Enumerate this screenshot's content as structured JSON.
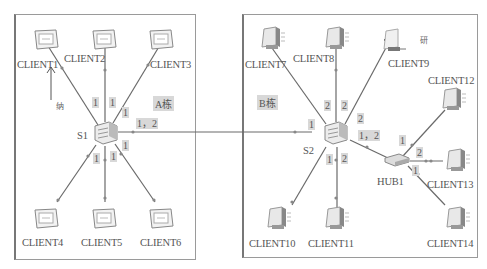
{
  "zones": [
    {
      "id": "A",
      "label": "A栋"
    },
    {
      "id": "B",
      "label": "B栋"
    }
  ],
  "notes": {
    "arrow_a": "纳",
    "arrow_b": "研"
  },
  "devices": {
    "s1": "S1",
    "s2": "S2",
    "hub1": "HUB1",
    "clients": [
      "CLIENT1",
      "CLIENT2",
      "CLIENT3",
      "CLIENT4",
      "CLIENT5",
      "CLIENT6",
      "CLIENT7",
      "CLIENT8",
      "CLIENT9",
      "CLIENT10",
      "CLIENT11",
      "CLIENT12",
      "CLIENT13",
      "CLIENT14"
    ]
  },
  "ports": {
    "c1": "1",
    "c2": "1",
    "c3": "1",
    "c4": "1",
    "c5": "1",
    "c6": "1",
    "s1_trunk": "1，2",
    "s2_in": "1",
    "c7": "2",
    "c8": "2",
    "c9": "2",
    "c10": "1",
    "c11": "2",
    "s2_hub": "1，2",
    "c12": "1",
    "c13": "2",
    "c14": "1"
  },
  "colors": {
    "line": "#6a6a6a",
    "frame": "#9a9a9a",
    "port_bg": "#d8d8d8"
  }
}
